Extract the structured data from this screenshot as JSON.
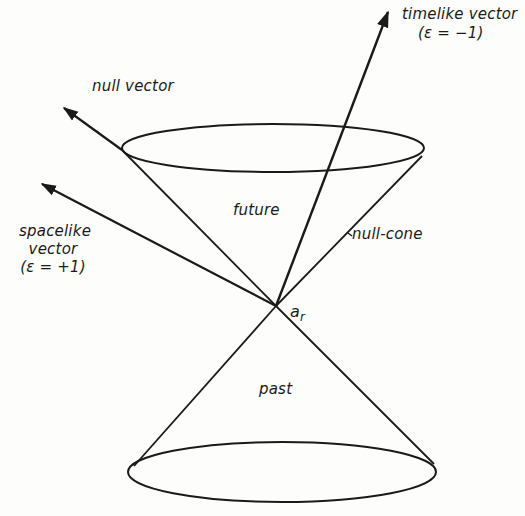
{
  "diagram": {
    "apex_label": "a",
    "apex_subscript": "r",
    "labels": {
      "timelike_vector": "timelike vector",
      "timelike_epsilon": "(ε = −1)",
      "null_vector": "null vector",
      "spacelike_line1": "spacelike",
      "spacelike_line2": "vector",
      "spacelike_epsilon": "(ε = +1)",
      "future": "future",
      "null_cone": "null-cone",
      "past": "past"
    },
    "colors": {
      "ink": "#1a1a1a",
      "paper": "#fdfdfb"
    }
  }
}
